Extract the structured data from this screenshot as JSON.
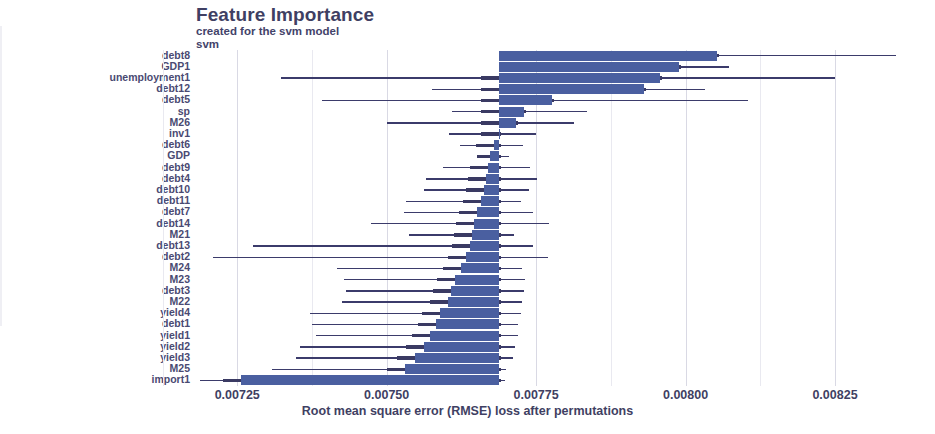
{
  "header": {
    "title": "Feature Importance",
    "subtitle_line1": "created for the svm model",
    "subtitle_line2": "svm"
  },
  "axis": {
    "x_title": "Root mean square error (RMSE) loss after permutations",
    "x_ticks": [
      "0.00725",
      "0.00750",
      "0.00775",
      "0.00800",
      "0.00825"
    ],
    "x_tick_values": [
      0.00725,
      0.0075,
      0.00775,
      0.008,
      0.00825
    ],
    "x_min": 0.007181,
    "x_max": 0.008352,
    "baseline_value": 0.0076875,
    "grid": true,
    "legend": "none"
  },
  "colors": {
    "bar": "#4a5fa0",
    "whisker": "#3b3b6b",
    "grid": "#d9d9e4",
    "text": "#3f3f63"
  },
  "chart_data": {
    "type": "bar",
    "orientation": "horizontal",
    "title": "Feature Importance",
    "subtitle": "created for the svm model",
    "model": "svm",
    "xlabel": "Root mean square error (RMSE) loss after permutations",
    "ylabel": "",
    "xlim": [
      0.007181,
      0.008352
    ],
    "baseline": 0.0076875,
    "grid": true,
    "categories": [
      "debt8",
      "GDP1",
      "unemployment1",
      "debt12",
      "debt5",
      "sp",
      "M26",
      "inv1",
      "debt6",
      "GDP",
      "debt9",
      "debt4",
      "debt10",
      "debt11",
      "debt7",
      "debt14",
      "M21",
      "debt13",
      "debt2",
      "M24",
      "M23",
      "debt3",
      "M22",
      "yield4",
      "debt1",
      "yield1",
      "yield2",
      "yield3",
      "M25",
      "import1"
    ],
    "values": [
      0.008052,
      0.007989,
      0.007957,
      0.007931,
      0.007777,
      0.007729,
      0.007717,
      0.007688,
      0.007679,
      0.007673,
      0.00767,
      0.007666,
      0.007662,
      0.007658,
      0.007651,
      0.007646,
      0.007642,
      0.007639,
      0.007633,
      0.007624,
      0.007615,
      0.007608,
      0.007602,
      0.00759,
      0.007582,
      0.007573,
      0.007563,
      0.007548,
      0.007531,
      0.007257
    ],
    "error_low": [
      0.007728,
      0.007789,
      0.007324,
      0.007575,
      0.007392,
      0.00761,
      0.0075,
      0.007605,
      0.007623,
      0.007651,
      0.007595,
      0.007565,
      0.007562,
      0.007533,
      0.007529,
      0.007474,
      0.007537,
      0.007276,
      0.007209,
      0.007417,
      0.007429,
      0.007432,
      0.007425,
      0.007372,
      0.007375,
      0.007381,
      0.007355,
      0.007349,
      0.007308,
      0.007187
    ],
    "error_high": [
      0.008352,
      0.008073,
      0.00825,
      0.008032,
      0.008104,
      0.007835,
      0.007814,
      0.00775,
      0.007728,
      0.007705,
      0.00774,
      0.007751,
      0.007738,
      0.007725,
      0.007744,
      0.007772,
      0.007713,
      0.007745,
      0.00777,
      0.007726,
      0.007731,
      0.007729,
      0.007726,
      0.007724,
      0.007719,
      0.00772,
      0.007715,
      0.007712,
      0.0077,
      0.007698
    ]
  }
}
